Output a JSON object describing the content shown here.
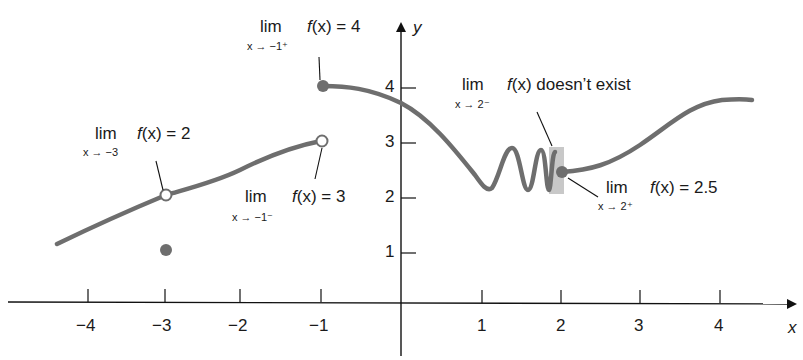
{
  "axes": {
    "x_label": "x",
    "y_label": "y",
    "x_ticks": [
      "−4",
      "−3",
      "−2",
      "−1",
      "1",
      "2",
      "3",
      "4"
    ],
    "y_ticks": [
      "1",
      "2",
      "3",
      "4"
    ]
  },
  "annotations": [
    {
      "lim": "lim",
      "sub": "x → −3",
      "expr_pre": "f",
      "expr_post": "(x) = 2",
      "text": "f(x) = 2"
    },
    {
      "lim": "lim",
      "sub": "x → −1⁻",
      "expr_pre": "f",
      "expr_post": "(x) = 3",
      "text": "f(x) = 3"
    },
    {
      "lim": "lim",
      "sub": "x → −1⁺",
      "expr_pre": "f",
      "expr_post": "(x) = 4",
      "text": "f(x) = 4"
    },
    {
      "lim": "lim",
      "sub": "x → 2⁻",
      "expr_pre": "f",
      "expr_post": "(x) doesn’t exist",
      "text": "f(x) doesn’t exist"
    },
    {
      "lim": "lim",
      "sub": "x → 2⁺",
      "expr_pre": "f",
      "expr_post": "(x) = 2.5",
      "text": "f(x) = 2.5"
    }
  ],
  "points": [
    {
      "x": -3,
      "y": 2,
      "type": "open"
    },
    {
      "x": -3,
      "y": 1,
      "type": "filled"
    },
    {
      "x": -1,
      "y": 3,
      "type": "open"
    },
    {
      "x": -1,
      "y": 4,
      "type": "filled"
    },
    {
      "x": 2,
      "y": 2.5,
      "type": "filled"
    }
  ],
  "colors": {
    "curve": "#6e6e6e",
    "axis": "#111111",
    "shade": "#c8c8c8",
    "text": "#1a1a1a"
  }
}
